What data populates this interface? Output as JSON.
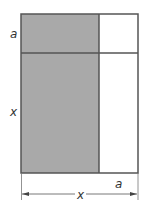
{
  "diagram": {
    "type": "area-model",
    "labels": {
      "left_top": "a",
      "left_main": "x",
      "bottom_small": "a",
      "bottom_total": "x"
    },
    "colors": {
      "shaded": "#a9a9a9",
      "outline": "#555555",
      "background": "#ffffff"
    },
    "regions": [
      {
        "name": "top-left",
        "shaded": true
      },
      {
        "name": "top-right",
        "shaded": false
      },
      {
        "name": "bottom-left",
        "shaded": true
      },
      {
        "name": "bottom-right",
        "shaded": false
      }
    ]
  }
}
